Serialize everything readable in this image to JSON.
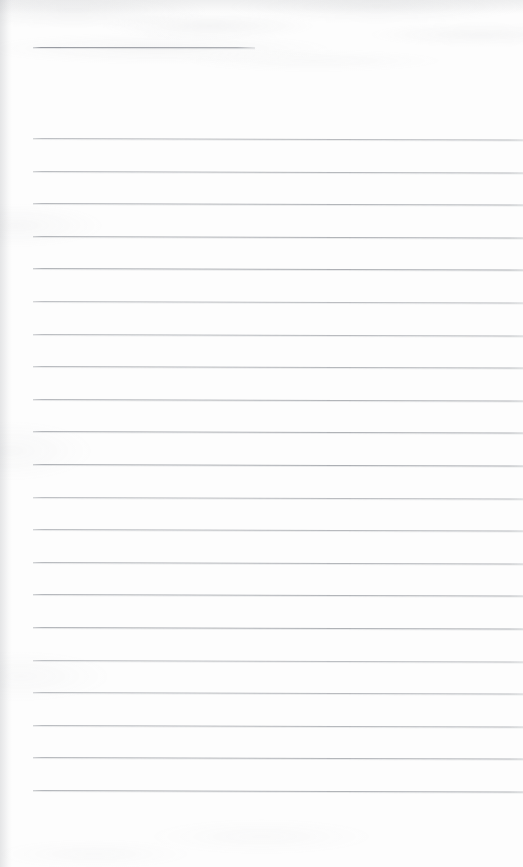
{
  "document": {
    "kind": "scanned-blank-ruled-notebook-page",
    "title_text": "",
    "body_text": "",
    "page_number_text": "",
    "width_px": 523,
    "height_px": 867
  },
  "colors": {
    "paper": "#fdfdfd",
    "rule_line": "#a8abb0",
    "header_rule_line": "#969aa0",
    "gutter_shadow": "#8f9298"
  },
  "layout": {
    "rule_left_px": 33,
    "rule_right_px": 518,
    "rule_spacing_px": 32.6,
    "rule_thickness_px": 1,
    "skew_drop_px": 1.6,
    "bottom_margin_px": 66
  },
  "header_rule": {
    "label": "title-rule",
    "y_px": 47,
    "x_start_px": 33,
    "x_end_px": 255,
    "text": ""
  },
  "rules": [
    {
      "index": 1,
      "y_px": 138,
      "text": ""
    },
    {
      "index": 2,
      "y_px": 171,
      "text": ""
    },
    {
      "index": 3,
      "y_px": 203,
      "text": ""
    },
    {
      "index": 4,
      "y_px": 236,
      "text": ""
    },
    {
      "index": 5,
      "y_px": 268,
      "text": ""
    },
    {
      "index": 6,
      "y_px": 301,
      "text": ""
    },
    {
      "index": 7,
      "y_px": 334,
      "text": ""
    },
    {
      "index": 8,
      "y_px": 366,
      "text": ""
    },
    {
      "index": 9,
      "y_px": 399,
      "text": ""
    },
    {
      "index": 10,
      "y_px": 431,
      "text": ""
    },
    {
      "index": 11,
      "y_px": 464,
      "text": ""
    },
    {
      "index": 12,
      "y_px": 497,
      "text": ""
    },
    {
      "index": 13,
      "y_px": 529,
      "text": ""
    },
    {
      "index": 14,
      "y_px": 562,
      "text": ""
    },
    {
      "index": 15,
      "y_px": 594,
      "text": ""
    },
    {
      "index": 16,
      "y_px": 627,
      "text": ""
    },
    {
      "index": 17,
      "y_px": 660,
      "text": ""
    },
    {
      "index": 18,
      "y_px": 692,
      "text": ""
    },
    {
      "index": 19,
      "y_px": 725,
      "text": ""
    },
    {
      "index": 20,
      "y_px": 757,
      "text": ""
    },
    {
      "index": 21,
      "y_px": 790,
      "text": ""
    }
  ]
}
